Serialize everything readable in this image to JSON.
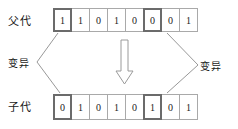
{
  "diagram": {
    "parent_row": {
      "label": "父代",
      "genes": [
        "1",
        "1",
        "0",
        "1",
        "0",
        "0",
        "0",
        "1"
      ],
      "mutated_indices": [
        0,
        5
      ]
    },
    "child_row": {
      "label": "子代",
      "genes": [
        "0",
        "1",
        "0",
        "1",
        "0",
        "1",
        "0",
        "1"
      ],
      "mutated_indices": [
        0,
        5
      ]
    },
    "annotations": {
      "mutation_left": "变异",
      "mutation_right": "变异"
    },
    "arrow": {
      "direction": "down",
      "style": "hollow-block-arrow"
    },
    "colors": {
      "cell_border": "#a9a9a9",
      "highlight_border": "#6b6b6b",
      "connector_line": "#8c8c8c",
      "text": "#222222",
      "background": "#ffffff"
    }
  }
}
